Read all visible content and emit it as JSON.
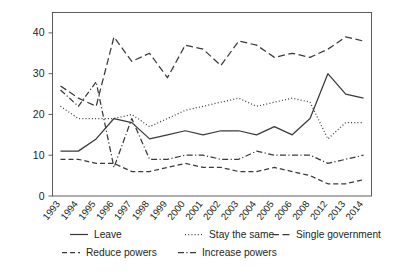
{
  "chart_data": {
    "type": "line",
    "title": "",
    "xlabel": "",
    "ylabel": "Per cent",
    "ylim": [
      0,
      45
    ],
    "yticks": [
      0,
      10,
      20,
      30,
      40
    ],
    "grid": false,
    "legend_position": "bottom",
    "categories": [
      "1993",
      "1994",
      "1995",
      "1996",
      "1997",
      "1998",
      "1999",
      "2000",
      "2001",
      "2002",
      "2003",
      "2004",
      "2005",
      "2006",
      "2008",
      "2012",
      "2013",
      "2014"
    ],
    "series": [
      {
        "name": "Leave",
        "dash": "solid",
        "values": [
          11,
          11,
          14,
          19,
          18,
          14,
          15,
          16,
          15,
          16,
          16,
          15,
          17,
          15,
          19,
          30,
          25,
          24
        ]
      },
      {
        "name": "Stay the same",
        "dash": "dotted",
        "values": [
          22,
          19,
          19,
          19,
          20,
          17,
          19,
          21,
          22,
          23,
          24,
          22,
          23,
          24,
          23,
          14,
          18,
          18
        ]
      },
      {
        "name": "Single government",
        "dash": "dashed-long",
        "values": [
          27,
          24,
          22,
          39,
          33,
          35,
          29,
          37,
          36,
          32,
          38,
          37,
          34,
          35,
          34,
          36,
          39,
          38
        ]
      },
      {
        "name": "Reduce powers",
        "dash": "dashed",
        "values": [
          9,
          9,
          8,
          8,
          6,
          6,
          7,
          8,
          7,
          7,
          6,
          6,
          7,
          6,
          5,
          3,
          3,
          4
        ]
      },
      {
        "name": "Increase powers",
        "dash": "dash-dot",
        "values": [
          26,
          22,
          28,
          7,
          19,
          9,
          9,
          10,
          10,
          9,
          9,
          11,
          10,
          10,
          10,
          8,
          9,
          10
        ]
      }
    ]
  },
  "legend": {
    "items": [
      {
        "label": "Leave",
        "dash": "solid"
      },
      {
        "label": "Stay the same",
        "dash": "dotted"
      },
      {
        "label": "Single government",
        "dash": "dashed-long"
      },
      {
        "label": "Reduce powers",
        "dash": "dashed"
      },
      {
        "label": "Increase powers",
        "dash": "dash-dot"
      }
    ]
  },
  "axis": {
    "y_label": "Per cent",
    "y_ticks": [
      "0",
      "10",
      "20",
      "30",
      "40"
    ],
    "x_ticks": [
      "1993",
      "1994",
      "1995",
      "1996",
      "1997",
      "1998",
      "1999",
      "2000",
      "2001",
      "2002",
      "2003",
      "2004",
      "2005",
      "2006",
      "2008",
      "2012",
      "2013",
      "2014"
    ]
  },
  "colors": {
    "line": "#3a3a3a",
    "axis": "#4d4d4d",
    "text": "#231f20",
    "background": "#ffffff"
  }
}
